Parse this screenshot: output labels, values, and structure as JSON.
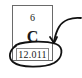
{
  "element": {
    "atomic_number": "6",
    "symbol": "C",
    "atomic_mass": "12.011"
  },
  "annotation": {
    "type": "circle-with-arrow",
    "target": "atomic_mass",
    "stroke_color": "#111111"
  },
  "colors": {
    "box_border": "#6a6a6a",
    "text": "#1a1a1a",
    "background": "#ffffff"
  }
}
